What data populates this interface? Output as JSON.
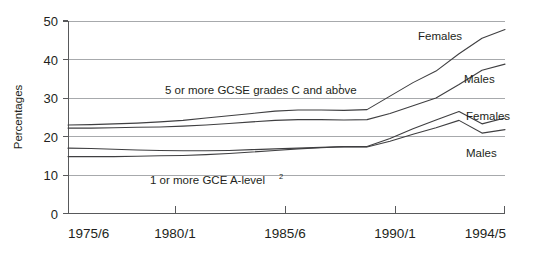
{
  "chart_data": {
    "type": "line",
    "title": "",
    "subtitle": "",
    "xlabel": "",
    "ylabel": "Percentages",
    "xlim": [
      1975.5,
      1994.5
    ],
    "ylim": [
      0,
      50
    ],
    "grid": true,
    "legend_position": "inline-end-labels",
    "x_tick_labels": [
      "1975/6",
      "1980/1",
      "1985/6",
      "1990/1",
      "1994/5"
    ],
    "x_tick_values": [
      1975.5,
      1980.5,
      1985.5,
      1990.5,
      1994.5
    ],
    "y_tick_labels": [
      "0",
      "10",
      "20",
      "30",
      "40",
      "50"
    ],
    "y_tick_values": [
      0,
      10,
      20,
      30,
      40,
      50
    ],
    "x": [
      1975.5,
      1976.5,
      1977.5,
      1978.5,
      1979.5,
      1980.5,
      1981.5,
      1982.5,
      1983.5,
      1984.5,
      1985.5,
      1986.5,
      1987.5,
      1988.5,
      1989.5,
      1990.5,
      1991.5,
      1992.5,
      1993.5,
      1994.5
    ],
    "series": [
      {
        "name": "5 or more GCSE grades C and above - Females",
        "group": "5 or more GCSE grades C and above",
        "label": "Females",
        "values": [
          23.0,
          23.1,
          23.3,
          23.5,
          23.8,
          24.2,
          24.8,
          25.4,
          26.0,
          26.6,
          26.9,
          26.9,
          26.8,
          27.0,
          30.5,
          34.0,
          37.0,
          41.5,
          45.5,
          47.8
        ]
      },
      {
        "name": "5 or more GCSE grades C and above - Males",
        "group": "5 or more GCSE grades C and above",
        "label": "Males",
        "values": [
          22.2,
          22.2,
          22.3,
          22.4,
          22.5,
          22.7,
          23.0,
          23.4,
          23.8,
          24.2,
          24.4,
          24.4,
          24.3,
          24.4,
          26.0,
          28.0,
          30.0,
          33.5,
          37.2,
          38.8
        ]
      },
      {
        "name": "1 or more GCE A-level - Females",
        "group": "1 or more GCE A-level",
        "label": "Females",
        "values": [
          14.8,
          14.8,
          14.8,
          14.9,
          15.0,
          15.1,
          15.3,
          15.6,
          16.0,
          16.4,
          16.8,
          17.1,
          17.4,
          17.4,
          19.5,
          22.0,
          24.3,
          26.5,
          23.3,
          24.8
        ]
      },
      {
        "name": "1 or more GCE A-level - Males",
        "group": "1 or more GCE A-level",
        "label": "Males",
        "values": [
          17.0,
          16.9,
          16.7,
          16.5,
          16.4,
          16.3,
          16.3,
          16.4,
          16.6,
          16.8,
          17.0,
          17.2,
          17.4,
          17.3,
          18.8,
          20.6,
          22.3,
          24.2,
          20.9,
          21.8
        ]
      }
    ],
    "annotations": [
      {
        "id": "gcse-annotation",
        "text": "5 or more GCSE grades C and above",
        "superscript": "1"
      },
      {
        "id": "alevel-annotation",
        "text": "1 or more GCE A-level",
        "superscript": "2"
      }
    ],
    "series_end_labels": [
      {
        "id": "gcse-females-label",
        "label": "Females"
      },
      {
        "id": "gcse-males-label",
        "label": "Males"
      },
      {
        "id": "alevel-females-label",
        "label": "Females"
      },
      {
        "id": "alevel-males-label",
        "label": "Males"
      }
    ],
    "colors": {
      "line": "#3f3f41",
      "grid": "#a7a9ac",
      "axis": "#58595b",
      "text": "#231f20",
      "background": "#ffffff"
    }
  }
}
